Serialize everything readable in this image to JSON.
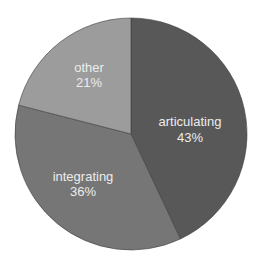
{
  "chart_data": {
    "type": "pie",
    "title": "",
    "start_angle_deg": 0,
    "direction": "clockwise",
    "categories": [
      "articulating",
      "integrating",
      "other"
    ],
    "values": [
      43,
      36,
      21
    ],
    "value_labels": [
      "43%",
      "36%",
      "21%"
    ],
    "colors": [
      "#585858",
      "#767676",
      "#9c9c9c"
    ],
    "label_color": "#ececec",
    "legend": "none"
  },
  "slices": [
    {
      "label": "articulating",
      "pct": "43%"
    },
    {
      "label": "integrating",
      "pct": "36%"
    },
    {
      "label": "other",
      "pct": "21%"
    }
  ]
}
